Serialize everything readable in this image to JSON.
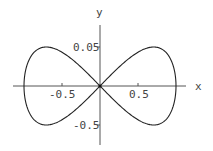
{
  "chart_data": {
    "type": "line",
    "title": "",
    "xlabel": "x",
    "ylabel": "y",
    "xlim": [
      -1.15,
      1.15
    ],
    "ylim": [
      -0.78,
      0.78
    ],
    "x_ticks": [
      {
        "value": -0.5,
        "label": "-0.5"
      },
      {
        "value": 0.5,
        "label": "0.5"
      }
    ],
    "y_ticks": [
      {
        "value": 0.5,
        "label": "0.05"
      },
      {
        "value": -0.5,
        "label": "-0.5"
      }
    ],
    "grid": false,
    "legend": null,
    "series": [
      {
        "name": "figure-eight curve",
        "parametric": "x = cos(t), y = sin(t)·cos(t)",
        "points": [
          [
            1.0,
            0.0
          ],
          [
            0.966,
            0.25
          ],
          [
            0.866,
            0.433
          ],
          [
            0.707,
            0.5
          ],
          [
            0.5,
            0.433
          ],
          [
            0.259,
            0.25
          ],
          [
            0.0,
            0.0
          ],
          [
            -0.259,
            -0.25
          ],
          [
            -0.5,
            -0.433
          ],
          [
            -0.707,
            -0.5
          ],
          [
            -0.866,
            -0.433
          ],
          [
            -0.966,
            -0.25
          ],
          [
            -1.0,
            0.0
          ],
          [
            -0.966,
            0.25
          ],
          [
            -0.866,
            0.433
          ],
          [
            -0.707,
            0.5
          ],
          [
            -0.5,
            0.433
          ],
          [
            -0.259,
            0.25
          ],
          [
            0.0,
            0.0
          ],
          [
            0.259,
            -0.25
          ],
          [
            0.5,
            -0.433
          ],
          [
            0.707,
            -0.5
          ],
          [
            0.866,
            -0.433
          ],
          [
            0.966,
            -0.25
          ],
          [
            1.0,
            0.0
          ]
        ]
      }
    ]
  },
  "colors": {
    "axis": "#555555",
    "curve": "#222222",
    "text": "#444444"
  }
}
